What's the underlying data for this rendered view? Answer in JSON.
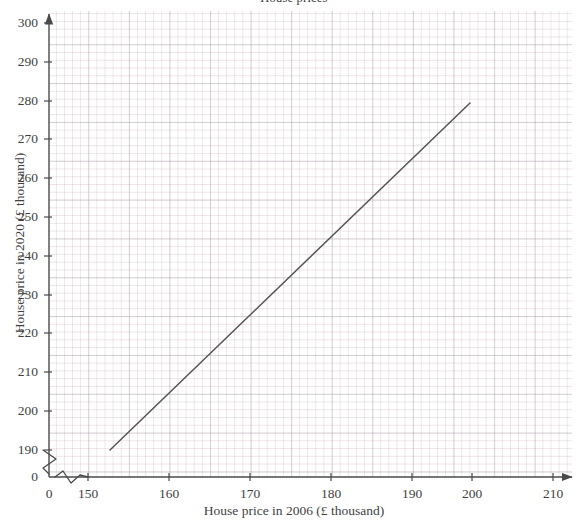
{
  "chart_data": {
    "type": "line",
    "title": "House prices",
    "xlabel": "House price in 2006 (£ thousand)",
    "ylabel": "House price in 2020 (£ thousand)",
    "grid": true,
    "grid_style": "graph-paper minor grid, major gridlines every 10 units",
    "legend": "none",
    "xlim": [
      150,
      213
    ],
    "ylim": [
      188,
      305
    ],
    "x_axis_break": true,
    "y_axis_break": true,
    "x_break_between": [
      0,
      150
    ],
    "y_break_between": [
      0,
      190
    ],
    "x_ticks": [
      {
        "label": "0",
        "value": 0,
        "px": 49
      },
      {
        "label": "150",
        "value": 150,
        "px": 88
      },
      {
        "label": "160",
        "value": 160,
        "px": 169
      },
      {
        "label": "170",
        "value": 170,
        "px": 250
      },
      {
        "label": "180",
        "value": 180,
        "px": 331
      },
      {
        "label": "190",
        "value": 190,
        "px": 412
      },
      {
        "label": "200",
        "value": 200,
        "px": 472
      },
      {
        "label": "210",
        "value": 210,
        "px": 553
      }
    ],
    "y_ticks": [
      {
        "label": "0",
        "value": 0,
        "px": 477
      },
      {
        "label": "190",
        "value": 190,
        "px": 450
      },
      {
        "label": "200",
        "value": 200,
        "px": 411
      },
      {
        "label": "210",
        "value": 210,
        "px": 372
      },
      {
        "label": "220",
        "value": 220,
        "px": 333
      },
      {
        "label": "230",
        "value": 230,
        "px": 295
      },
      {
        "label": "240",
        "value": 240,
        "px": 256
      },
      {
        "label": "250",
        "value": 250,
        "px": 217
      },
      {
        "label": "260",
        "value": 260,
        "px": 178
      },
      {
        "label": "270",
        "value": 270,
        "px": 139
      },
      {
        "label": "280",
        "value": 280,
        "px": 101
      },
      {
        "label": "290",
        "value": 290,
        "px": 62
      },
      {
        "label": "300",
        "value": 300,
        "px": 23
      }
    ],
    "series": [
      {
        "name": "Line of best fit",
        "type": "line",
        "color": "#555555",
        "points": [
          {
            "x": 152,
            "y": 190
          },
          {
            "x": 200,
            "y": 285
          }
        ],
        "pixel_points": [
          {
            "px": 110,
            "py": 450
          },
          {
            "px": 470,
            "py": 103
          }
        ]
      }
    ],
    "axis_color": "#4a4a4a",
    "grid_major_color": "#9696a5",
    "grid_minor_color": "#c6aab4"
  }
}
